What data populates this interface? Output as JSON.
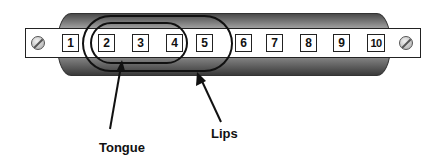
{
  "diagram": {
    "holes": [
      "1",
      "2",
      "3",
      "4",
      "5",
      "6",
      "7",
      "8",
      "9",
      "10"
    ],
    "regions": [
      {
        "name": "tongue",
        "covers_holes": [
          "2",
          "3",
          "4"
        ]
      },
      {
        "name": "lips",
        "covers_holes": [
          "2",
          "3",
          "4",
          "5"
        ]
      }
    ],
    "labels": {
      "tongue": "Tongue",
      "lips": "Lips"
    },
    "colors": {
      "outline": "#111111",
      "background": "#ffffff",
      "body_dark": "#3a3a3a",
      "body_light": "#e8e8e8"
    }
  }
}
